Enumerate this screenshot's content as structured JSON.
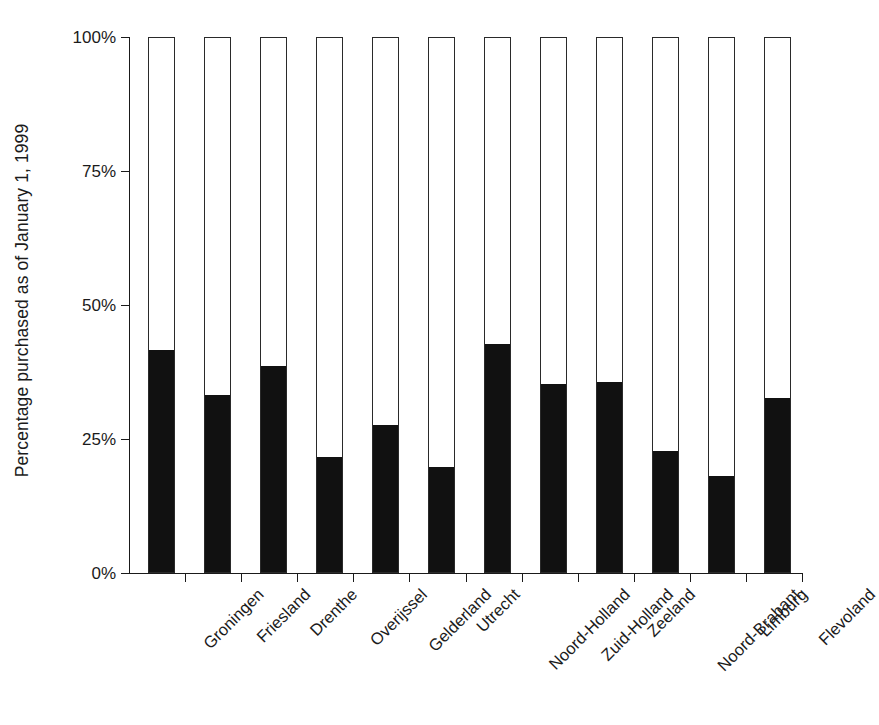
{
  "chart_data": {
    "type": "bar",
    "title": "",
    "subtitle": "",
    "xlabel": "",
    "ylabel": "Percentage purchased as of January 1, 1999",
    "ylim": [
      0,
      100
    ],
    "yticks": [
      0,
      25,
      50,
      75,
      100
    ],
    "ytick_labels": [
      "0%",
      "25%",
      "50%",
      "75%",
      "100%"
    ],
    "grid": false,
    "legend": null,
    "legend_position": "none",
    "bar_style": "outlined-to-100-with-filled-portion",
    "fill_color": "#111111",
    "outline_color": "#2a2a2a",
    "background_color": "#ffffff",
    "categories": [
      "Groningen",
      "Friesland",
      "Drenthe",
      "Overijssel",
      "Gelderland",
      "Utrecht",
      "Noord-Holland",
      "Zuid-Holland",
      "Zeeland",
      "Noord-Brabant",
      "Limburg",
      "Flevoland"
    ],
    "values": [
      41.5,
      33.0,
      38.5,
      21.5,
      27.5,
      19.5,
      42.5,
      35.0,
      35.5,
      22.5,
      18.0,
      32.5
    ],
    "series": [
      {
        "name": "Percentage purchased",
        "values": [
          41.5,
          33.0,
          38.5,
          21.5,
          27.5,
          19.5,
          42.5,
          35.0,
          35.5,
          22.5,
          18.0,
          32.5
        ]
      }
    ],
    "total_value": 100
  }
}
